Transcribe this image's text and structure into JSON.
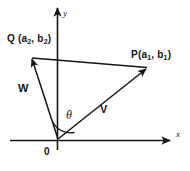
{
  "figure": {
    "background_color": "#ffffff",
    "ink_color": "#141414",
    "axes": {
      "x_label": "x",
      "y_label": "y",
      "origin_label": "0"
    },
    "points": [
      {
        "id": "Q",
        "label_prefix": "Q",
        "label_open": " (a",
        "sub1": "2",
        "label_mid": ", b",
        "sub2": "2",
        "label_close": ")",
        "full_label": "Q (a2, b2)"
      },
      {
        "id": "P",
        "label_prefix": "P",
        "label_open": "(a",
        "sub1": "1",
        "label_mid": ", b",
        "sub2": "1",
        "label_close": ")",
        "full_label": "P(a1, b1)"
      }
    ],
    "vectors": [
      {
        "id": "W",
        "label": "W",
        "from": "origin",
        "to": "Q"
      },
      {
        "id": "V",
        "label": "V",
        "from": "origin",
        "to": "P"
      }
    ],
    "angle": {
      "label": "θ",
      "between": "V and W"
    },
    "segments": [
      {
        "id": "QP",
        "from": "Q",
        "to": "P"
      }
    ]
  }
}
